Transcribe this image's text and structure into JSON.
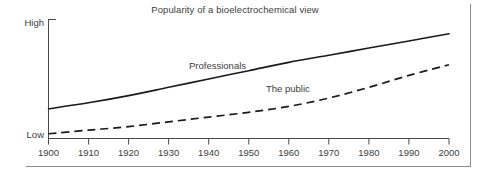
{
  "chart_data": {
    "type": "line",
    "title": "Popularity of a bioelectrochemical view",
    "xlabel": "",
    "ylabel": "",
    "x": [
      1900,
      1910,
      1920,
      1930,
      1940,
      1950,
      1960,
      1970,
      1980,
      1990,
      2000
    ],
    "xlim": [
      1900,
      2000
    ],
    "ylim": [
      0,
      100
    ],
    "ytick_labels": [
      "Low",
      "High"
    ],
    "xtick_labels": [
      "1900",
      "1910",
      "1920",
      "1930",
      "1940",
      "1950",
      "1960",
      "1970",
      "1980",
      "1990",
      "2000"
    ],
    "grid": false,
    "legend": "inline-labels",
    "series": [
      {
        "name": "Professionals",
        "style": "solid",
        "color": "#1a1a1a",
        "values": [
          25,
          30,
          36,
          43,
          50,
          57,
          64,
          70,
          76,
          82,
          88
        ]
      },
      {
        "name": "The public",
        "style": "dashed",
        "color": "#1a1a1a",
        "values": [
          4,
          7,
          10,
          14,
          18,
          22,
          27,
          34,
          43,
          53,
          62
        ]
      }
    ],
    "annotations": [
      {
        "text": "Professionals",
        "x": 1938,
        "y": 62
      },
      {
        "text": "The public",
        "x": 1960,
        "y": 40
      }
    ]
  },
  "axes": {
    "y_high_label": "High",
    "y_low_label": "Low",
    "x_ticks": [
      "1900",
      "1910",
      "1920",
      "1930",
      "1940",
      "1950",
      "1960",
      "1970",
      "1980",
      "1990",
      "2000"
    ]
  },
  "series_labels": {
    "professionals": "Professionals",
    "the_public": "The public"
  },
  "colors": {
    "line": "#1a1a1a",
    "axis": "#4a4a4a",
    "frame": "#8c8c8c",
    "text": "#3c3c3c",
    "background": "#ffffff"
  }
}
